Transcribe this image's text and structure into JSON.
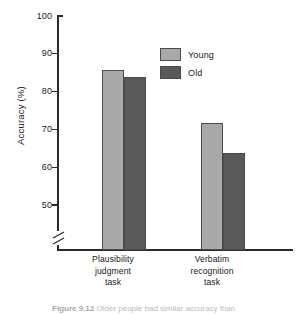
{
  "figure": {
    "caption_label": "Figure 9.12",
    "caption_text": "Older people had similar accuracy than"
  },
  "legend": {
    "position": "inside-top-right",
    "entries": [
      {
        "label": "Young",
        "color": "#a9a9a9"
      },
      {
        "label": "Old",
        "color": "#595959"
      }
    ]
  },
  "axes": {
    "ylabel": "Accuracy (%)",
    "ytick_labels": [
      "100",
      "90",
      "80",
      "70",
      "60",
      "50"
    ],
    "break_symbol": "axis-break"
  },
  "chart_data": {
    "type": "bar",
    "title": "",
    "xlabel": "",
    "ylabel": "Accuracy (%)",
    "ylim": [
      50,
      100
    ],
    "yticks": [
      50,
      60,
      70,
      80,
      90,
      100
    ],
    "axis_break": true,
    "grid": false,
    "legend_position": "inside top right",
    "categories": [
      "Plausibility judgment task",
      "Verbatim recognition task"
    ],
    "series": [
      {
        "name": "Young",
        "color": "#a9a9a9",
        "values": [
          86,
          72
        ]
      },
      {
        "name": "Old",
        "color": "#595959",
        "values": [
          84,
          64
        ]
      }
    ]
  }
}
